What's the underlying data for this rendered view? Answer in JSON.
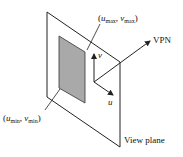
{
  "diagram": {
    "labels": {
      "top_corner": {
        "open": "(",
        "u": "u",
        "u_sub": "max",
        "sep": ", ",
        "v": "v",
        "v_sub": "max",
        "close": ")"
      },
      "bottom_corner": {
        "open": "(",
        "u": "u",
        "u_sub": "min",
        "sep": ", ",
        "v": "v",
        "v_sub": "min",
        "close": ")"
      },
      "vpn": "VPN",
      "v_axis": "v",
      "u_axis": "u",
      "view_plane": "View plane"
    },
    "colors": {
      "line": "#222222",
      "window_fill": "#a9a9a9"
    }
  }
}
